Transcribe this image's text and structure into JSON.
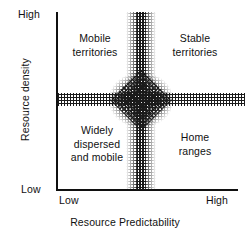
{
  "chart_data": {
    "type": "scatter",
    "title": "",
    "xlabel": "Resource Predictability",
    "ylabel": "Resource density",
    "x_ticks": [
      "Low",
      "High"
    ],
    "y_ticks": [
      "Low",
      "High"
    ],
    "xlim": [
      "Low",
      "High"
    ],
    "ylim": [
      "Low",
      "High"
    ],
    "grid": false,
    "legend": "none",
    "quadrants": [
      {
        "id": "top-left",
        "label": "Mobile\nterritories",
        "x_region": "low predictability",
        "y_region": "high density"
      },
      {
        "id": "top-right",
        "label": "Stable\nterritories",
        "x_region": "high predictability",
        "y_region": "high density"
      },
      {
        "id": "bottom-left",
        "label": "Widely\ndispersed\nand mobile",
        "x_region": "low predictability",
        "y_region": "low density"
      },
      {
        "id": "bottom-right",
        "label": "Home\nranges",
        "x_region": "high predictability",
        "y_region": "low density"
      }
    ],
    "annotations": [
      {
        "name": "vertical-transition-band",
        "orientation": "vertical",
        "description": "stippled transition zone at mid Resource Predictability"
      },
      {
        "name": "horizontal-transition-band",
        "orientation": "horizontal",
        "description": "stippled transition zone at mid Resource density"
      },
      {
        "name": "intersection-diamond",
        "orientation": "diamond",
        "description": "dense stippled diamond where the two transition bands cross"
      }
    ]
  },
  "axes": {
    "y_title": "Resource density",
    "x_title": "Resource Predictability",
    "y_high": "High",
    "y_low": "Low",
    "x_low": "Low",
    "x_high": "High"
  },
  "quadrant_labels": {
    "top_left": "Mobile\nterritories",
    "top_right": "Stable\nterritories",
    "bottom_left": "Widely\ndispersed\nand mobile",
    "bottom_right": "Home\nranges"
  },
  "colors": {
    "background": "#ffffff",
    "axis": "#101010",
    "text": "#111111",
    "stipple": "#1a1a1a"
  }
}
